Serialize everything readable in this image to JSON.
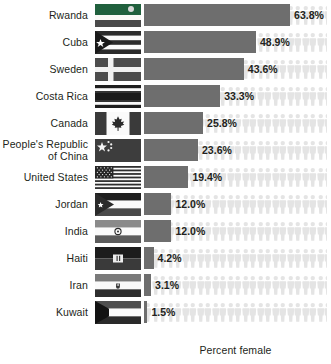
{
  "chart_data": {
    "type": "bar",
    "title": "",
    "xlabel": "Percent female",
    "ylabel": "",
    "xlim": [
      0,
      80
    ],
    "grid": false,
    "legend": "none",
    "orientation": "horizontal",
    "categories": [
      "Rwanda",
      "Cuba",
      "Sweden",
      "Costa Rica",
      "Canada",
      "People's Republic\nof China",
      "United States",
      "Jordan",
      "India",
      "Haiti",
      "Iran",
      "Kuwait"
    ],
    "values": [
      63.8,
      48.9,
      43.6,
      33.3,
      25.8,
      23.6,
      19.4,
      12.0,
      12.0,
      4.2,
      3.1,
      1.5
    ],
    "value_labels": [
      "63.8%",
      "48.9%",
      "43.6%",
      "33.3%",
      "25.8%",
      "23.6%",
      "19.4%",
      "12.0%",
      "12.0%",
      "4.2%",
      "3.1%",
      "1.5%"
    ],
    "flags": [
      "rwanda-flag",
      "cuba-flag",
      "sweden-flag",
      "costa-rica-flag",
      "canada-flag",
      "china-flag",
      "united-states-flag",
      "jordan-flag",
      "india-flag",
      "haiti-flag",
      "iran-flag",
      "kuwait-flag"
    ],
    "bar_color": "#6e6e6e",
    "person_icon_color": "#e4e4e4",
    "text_color": "#231f20",
    "background_color": "#ffffff"
  },
  "axis": {
    "caption": "Percent female"
  }
}
